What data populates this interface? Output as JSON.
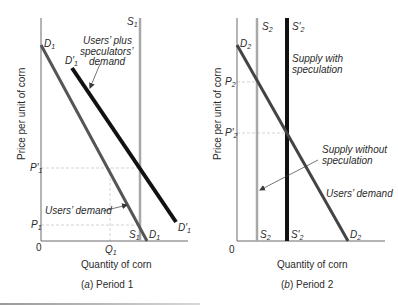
{
  "colors": {
    "axis": "#6a6a6a",
    "demand": "#555555",
    "shifted_demand": "#111111",
    "supply_gray": "#a8a8a8",
    "supply_black": "#111111",
    "guide": "#c8c8c8",
    "text": "#2a2a2a"
  },
  "panel_a": {
    "caption_letter": "a",
    "caption_text": " Period 1",
    "x_axis_title": "Quantity of corn",
    "y_axis_title": "Price per unit of corn",
    "origin": "0",
    "labels": {
      "S1_top": "S",
      "S1_top_sub": "1",
      "S1_bottom": "S",
      "S1_bottom_sub": "1",
      "D1_top": "D",
      "D1_top_sub": "1",
      "D1_bottom": "D",
      "D1_bottom_sub": "1",
      "D1p_top": "D′",
      "D1p_top_sub": "1",
      "D1p_bottom": "D′",
      "D1p_bottom_sub": "1",
      "P1p": "P′",
      "P1p_sub": "1",
      "P1": "P",
      "P1_sub": "1",
      "Q1": "Q",
      "Q1_sub": "1"
    },
    "annotations": {
      "users_plus_line1": "Users’ plus",
      "users_plus_line2": "speculators’",
      "users_plus_line3": "demand",
      "users_demand": "Users’ demand"
    }
  },
  "panel_b": {
    "caption_letter": "b",
    "caption_text": " Period 2",
    "x_axis_title": "Quantity of corn",
    "y_axis_title": "Price per unit of corn",
    "origin": "0",
    "labels": {
      "S2_top": "S",
      "S2_top_sub": "2",
      "S2_bottom": "S",
      "S2_bottom_sub": "2",
      "S2p_top": "S′",
      "S2p_top_sub": "2",
      "S2p_bottom": "S′",
      "S2p_bottom_sub": "2",
      "D2_top": "D",
      "D2_top_sub": "2",
      "D2_bottom": "D",
      "D2_bottom_sub": "2",
      "P2": "P",
      "P2_sub": "2",
      "P2p": "P′",
      "P2p_sub": "2"
    },
    "annotations": {
      "supply_with_line1": "Supply with",
      "supply_with_line2": "speculation",
      "supply_without_line1": "Supply without",
      "supply_without_line2": "speculation",
      "users_demand": "Users’ demand"
    }
  }
}
